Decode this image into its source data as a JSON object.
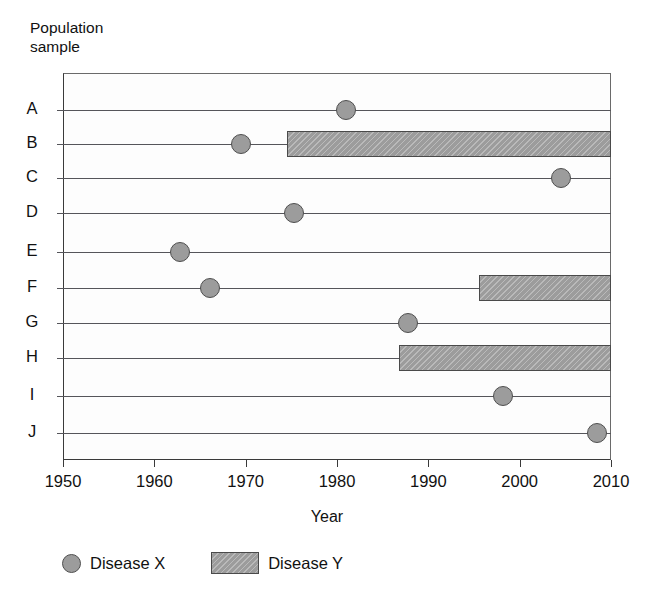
{
  "chart_data": {
    "type": "timeline",
    "title": "",
    "xlabel": "Year",
    "ylabel": "Population\nsample",
    "xlim": [
      1950,
      2010
    ],
    "xticks": [
      1950,
      1960,
      1970,
      1980,
      1990,
      2000,
      2010
    ],
    "xtick_labels": [
      "1950",
      "1960",
      "1970",
      "1980",
      "1990",
      "2000",
      "2010"
    ],
    "categories": [
      "A",
      "B",
      "C",
      "D",
      "E",
      "F",
      "G",
      "H",
      "I",
      "J"
    ],
    "grid": false,
    "legend_position": "below-axes",
    "legend": [
      {
        "key": "disease_x",
        "label": "Disease X",
        "marker": "circle",
        "color": "#9c9c9c"
      },
      {
        "key": "disease_y",
        "label": "Disease Y",
        "marker": "hatched-bar",
        "color": "#9c9c9c"
      }
    ],
    "series": [
      {
        "name": "Disease X",
        "type": "scatter",
        "marker": "circle",
        "points": [
          {
            "category": "A",
            "year": 1981.0
          },
          {
            "category": "B",
            "year": 1969.5
          },
          {
            "category": "C",
            "year": 2004.5
          },
          {
            "category": "D",
            "year": 1975.3
          },
          {
            "category": "E",
            "year": 1962.8
          },
          {
            "category": "F",
            "year": 1966.1
          },
          {
            "category": "G",
            "year": 1987.8
          },
          {
            "category": "I",
            "year": 1998.2
          },
          {
            "category": "J",
            "year": 2008.5
          }
        ]
      },
      {
        "name": "Disease Y",
        "type": "span",
        "marker": "hatched-bar",
        "spans": [
          {
            "category": "B",
            "start": 1974.5,
            "end": 2010.0
          },
          {
            "category": "F",
            "start": 1995.5,
            "end": 2010.0
          },
          {
            "category": "H",
            "start": 1986.8,
            "end": 2010.0
          }
        ]
      }
    ]
  },
  "axis": {
    "y_title": "Population\nsample",
    "x_title": "Year"
  },
  "colors": {
    "marker_fill": "#9c9c9c",
    "marker_edge": "#4f4f4f",
    "bar_fill": "#9c9c9c",
    "bar_edge": "#4a4a4a",
    "row_line": "#55555a",
    "frame": "#3a3a3a",
    "text": "#111111",
    "background": "#ffffff"
  }
}
